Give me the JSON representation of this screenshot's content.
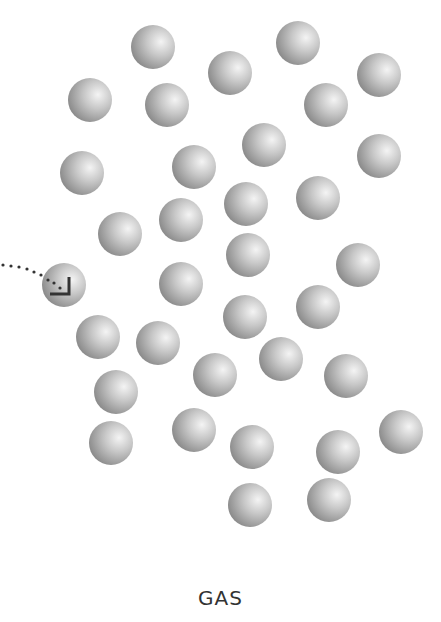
{
  "diagram": {
    "label": "GAS",
    "sphere_radius": 22,
    "colors": {
      "sphere_light": "#f2f2f2",
      "sphere_mid": "#bdbdbd",
      "sphere_dark": "#8a8a8a",
      "path": "#333333",
      "label": "#333333"
    },
    "molecules": [
      {
        "x": 153,
        "y": 47
      },
      {
        "x": 298,
        "y": 43
      },
      {
        "x": 230,
        "y": 73
      },
      {
        "x": 379,
        "y": 75
      },
      {
        "x": 90,
        "y": 100
      },
      {
        "x": 167,
        "y": 105
      },
      {
        "x": 326,
        "y": 105
      },
      {
        "x": 264,
        "y": 145
      },
      {
        "x": 379,
        "y": 156
      },
      {
        "x": 82,
        "y": 173
      },
      {
        "x": 194,
        "y": 167
      },
      {
        "x": 246,
        "y": 204
      },
      {
        "x": 318,
        "y": 198
      },
      {
        "x": 181,
        "y": 220
      },
      {
        "x": 120,
        "y": 234
      },
      {
        "x": 248,
        "y": 255
      },
      {
        "x": 358,
        "y": 265
      },
      {
        "x": 181,
        "y": 284
      },
      {
        "x": 245,
        "y": 317
      },
      {
        "x": 318,
        "y": 307
      },
      {
        "x": 98,
        "y": 337
      },
      {
        "x": 158,
        "y": 343
      },
      {
        "x": 281,
        "y": 359
      },
      {
        "x": 215,
        "y": 375
      },
      {
        "x": 346,
        "y": 376
      },
      {
        "x": 116,
        "y": 392
      },
      {
        "x": 194,
        "y": 430
      },
      {
        "x": 111,
        "y": 443
      },
      {
        "x": 252,
        "y": 447
      },
      {
        "x": 338,
        "y": 452
      },
      {
        "x": 401,
        "y": 432
      },
      {
        "x": 250,
        "y": 505
      },
      {
        "x": 329,
        "y": 500
      }
    ],
    "tracked_molecule": {
      "x": 64,
      "y": 285
    },
    "trajectory_dots": [
      {
        "x": 3,
        "y": 265
      },
      {
        "x": 11,
        "y": 266
      },
      {
        "x": 19,
        "y": 267
      },
      {
        "x": 27,
        "y": 269
      },
      {
        "x": 34,
        "y": 272
      },
      {
        "x": 41,
        "y": 275
      },
      {
        "x": 48,
        "y": 280
      },
      {
        "x": 54,
        "y": 283
      },
      {
        "x": 60,
        "y": 288
      }
    ]
  }
}
